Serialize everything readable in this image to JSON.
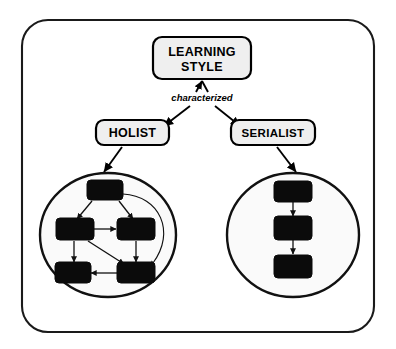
{
  "diagram": {
    "title_node": {
      "label_line1": "LEARNING",
      "label_line2": "STYLE"
    },
    "relation_label": "characterized",
    "categories": [
      {
        "id": "holist",
        "label": "HOLIST"
      },
      {
        "id": "serialist",
        "label": "SERIALIST"
      }
    ],
    "clusters": {
      "holist": {
        "name": "holist-network",
        "node_count": 5,
        "nodes": [
          {
            "id": "h-top",
            "cx": 105,
            "cy": 190
          },
          {
            "id": "h-midl",
            "cx": 75,
            "cy": 229
          },
          {
            "id": "h-midr",
            "cx": 135,
            "cy": 229
          },
          {
            "id": "h-botl",
            "cx": 73,
            "cy": 272
          },
          {
            "id": "h-botr",
            "cx": 135,
            "cy": 272
          }
        ],
        "edges": [
          {
            "from": "h-top",
            "to": "h-midl"
          },
          {
            "from": "h-top",
            "to": "h-midr"
          },
          {
            "from": "h-top",
            "to": "h-botr"
          },
          {
            "from": "h-midl",
            "to": "h-midr"
          },
          {
            "from": "h-midl",
            "to": "h-botl"
          },
          {
            "from": "h-midl",
            "to": "h-botr"
          },
          {
            "from": "h-midr",
            "to": "h-botr"
          },
          {
            "from": "h-botr",
            "to": "h-botl"
          }
        ]
      },
      "serialist": {
        "name": "serialist-chain",
        "node_count": 3,
        "nodes": [
          {
            "id": "s-1",
            "cx": 293,
            "cy": 191
          },
          {
            "id": "s-2",
            "cx": 293,
            "cy": 228
          },
          {
            "id": "s-3",
            "cx": 293,
            "cy": 266
          }
        ],
        "edges": [
          {
            "from": "s-1",
            "to": "s-2"
          },
          {
            "from": "s-2",
            "to": "s-3"
          }
        ]
      }
    },
    "colors": {
      "node_fill": "#0b0b0b",
      "box_fill": "#efefef",
      "stroke": "#000000",
      "circle_fill": "#fafafa",
      "background": "#ffffff"
    }
  }
}
